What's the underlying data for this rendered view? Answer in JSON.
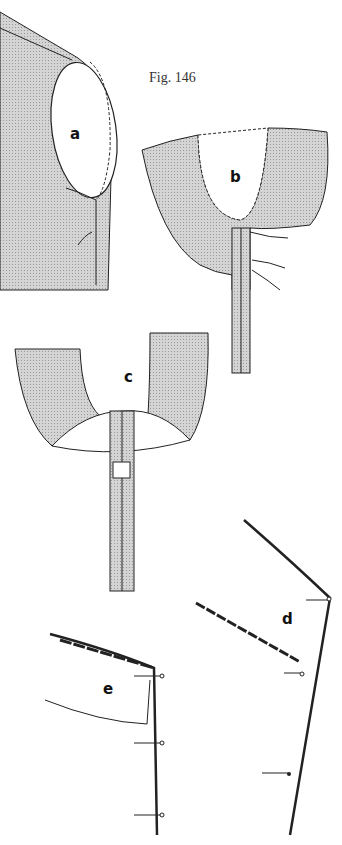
{
  "figure": {
    "title": "Fig. 146",
    "colors": {
      "background": "#ffffff",
      "fabric_fill": "#c8c8c8",
      "line": "#222222"
    },
    "panels": [
      {
        "id": "a",
        "label": "a"
      },
      {
        "id": "b",
        "label": "b"
      },
      {
        "id": "c",
        "label": "c"
      },
      {
        "id": "d",
        "label": "d"
      },
      {
        "id": "e",
        "label": "e"
      }
    ]
  }
}
